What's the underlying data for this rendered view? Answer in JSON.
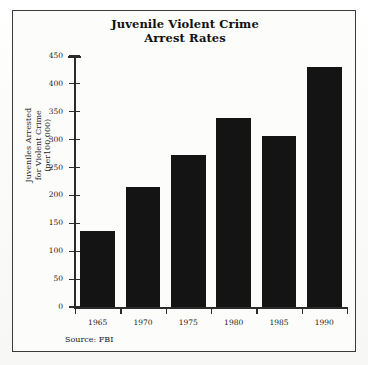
{
  "figure": {
    "title_lines": [
      "Juvenile Violent Crime",
      "Arrest Rates"
    ],
    "source_note": "Source: FBI",
    "y_axis_title_lines": [
      "Juveniles Arrested",
      "for Violent Crime",
      "(per100,000)"
    ],
    "bar_color": "#141414",
    "axis_color": "#2b2b2b",
    "frame_color": "#3a3a3a",
    "background_color": "#fcfcfb"
  },
  "chart_data": {
    "type": "bar",
    "title": "Juvenile Violent Crime Arrest Rates",
    "xlabel": "",
    "ylabel": "Juveniles Arrested for Violent Crime (per100,000)",
    "categories": [
      "1965",
      "1970",
      "1975",
      "1980",
      "1985",
      "1990"
    ],
    "values": [
      137,
      215,
      272,
      338,
      307,
      430
    ],
    "ylim": [
      0,
      450
    ],
    "ytick_labels": [
      "0",
      "50",
      "100",
      "150",
      "200",
      "250",
      "300",
      "350",
      "400",
      "450"
    ],
    "ytick_values": [
      0,
      50,
      100,
      150,
      200,
      250,
      300,
      350,
      400,
      450
    ],
    "grid": false,
    "legend": false,
    "annotations": [
      "Source: FBI"
    ]
  }
}
